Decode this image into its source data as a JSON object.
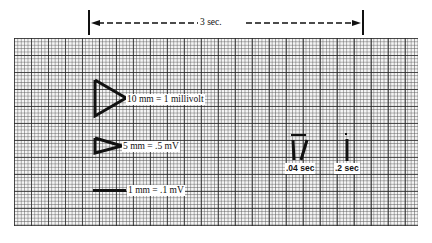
{
  "duration_bar": {
    "label": "3 sec."
  },
  "calibrations": [
    {
      "label": "10 mm = 1 millivolt"
    },
    {
      "label": "5 mm = .5 mV"
    },
    {
      "label": "1 mm = .1 mV"
    }
  ],
  "time_markers": [
    {
      "label": ".04 sec"
    },
    {
      "label": ".2 sec"
    }
  ]
}
